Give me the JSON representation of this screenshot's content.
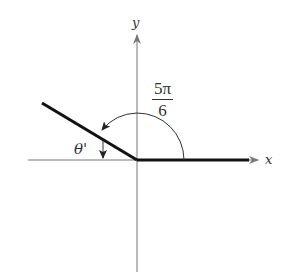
{
  "diagram": {
    "type": "angle-in-standard-position",
    "axes": {
      "x_label": "x",
      "y_label": "y"
    },
    "angle": {
      "label_numerator": "5π",
      "label_denominator": "6",
      "value": "5π/6",
      "degrees": 150
    },
    "reference_angle": {
      "label": "θ'",
      "degrees": 30
    },
    "colors": {
      "axis": "#777777",
      "ray": "#111111",
      "arc": "#333333",
      "text": "#333333"
    }
  }
}
